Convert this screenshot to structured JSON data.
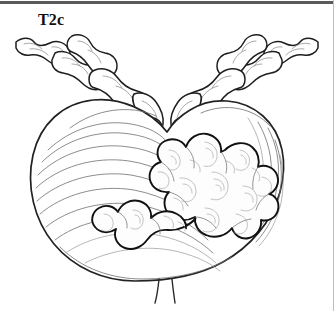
{
  "figure": {
    "domain": "medical-illustration",
    "stage_label": "T2c",
    "title": "T2c",
    "background_color": "#ffffff",
    "ink_color": "#1a1a1a",
    "shading_color": "#8a8a8a",
    "description_parts": [
      "prostate-gland-body",
      "left-seminal-vesicle",
      "right-seminal-vesicle",
      "tumor-mass",
      "urethra-stump"
    ]
  },
  "rules": {
    "top_bar_color": "#5a5a5a",
    "right_border_color": "#bdbdbd"
  },
  "labels": {
    "stage": "T2c"
  },
  "anatomy": {
    "gland": {
      "name": "prostate-gland",
      "hatch_line_count": 13,
      "outline_color": "#222222"
    },
    "left_vesicle": {
      "name": "left-seminal-vesicle",
      "lobe_count": 6
    },
    "right_vesicle": {
      "name": "right-seminal-vesicle",
      "lobe_count": 6
    },
    "tumor": {
      "name": "tumor-mass",
      "location": "right-posterior-lobe-extending-inferiorly",
      "lobule_count": 9,
      "contour_ring_count": 22,
      "outline_color": "#111111"
    },
    "urethra": {
      "name": "urethra-stump",
      "line_count": 2
    }
  }
}
